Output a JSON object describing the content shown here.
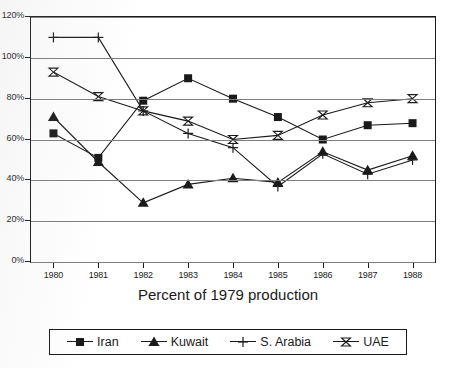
{
  "chart_data": {
    "type": "line",
    "title": "",
    "xlabel": "Percent of 1979 production",
    "ylabel": "",
    "x": [
      "1980",
      "1981",
      "1982",
      "1983",
      "1984",
      "1985",
      "1986",
      "1987",
      "1988"
    ],
    "categories": [
      "1980",
      "1981",
      "1982",
      "1983",
      "1984",
      "1985",
      "1986",
      "1987",
      "1988"
    ],
    "ylim": [
      0,
      120
    ],
    "yticks": [
      0,
      20,
      40,
      60,
      80,
      100,
      120
    ],
    "ytick_labels": [
      "0%",
      "20%",
      "40%",
      "60%",
      "80%",
      "100%",
      "120%"
    ],
    "grid": true,
    "legend_position": "bottom",
    "note_ytick_labels_clipped_at_left_edge": true,
    "series": [
      {
        "name": "Iran",
        "marker": "filled-square",
        "color": "#1a1a1a",
        "values": [
          63,
          51,
          79,
          90,
          80,
          71,
          60,
          67,
          68
        ]
      },
      {
        "name": "Kuwait",
        "marker": "filled-triangle",
        "color": "#1a1a1a",
        "values": [
          71,
          49,
          29,
          38,
          41,
          39,
          54,
          45,
          52
        ]
      },
      {
        "name": "S. Arabia",
        "marker": "plus",
        "color": "#1a1a1a",
        "values": [
          110,
          110,
          74,
          63,
          56,
          37,
          53,
          43,
          50
        ]
      },
      {
        "name": "UAE",
        "marker": "bowtie",
        "color": "#1a1a1a",
        "values": [
          93,
          81,
          74,
          69,
          60,
          62,
          72,
          78,
          80
        ]
      }
    ]
  },
  "legend": {
    "entries": [
      {
        "label": "Iran",
        "marker": "filled-square"
      },
      {
        "label": "Kuwait",
        "marker": "filled-triangle"
      },
      {
        "label": "S. Arabia",
        "marker": "plus"
      },
      {
        "label": "UAE",
        "marker": "bowtie"
      }
    ]
  }
}
